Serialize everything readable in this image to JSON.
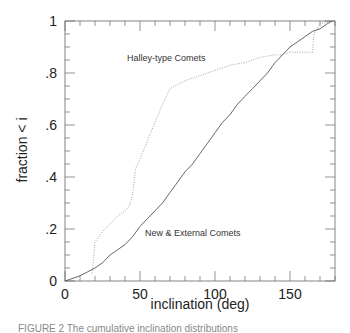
{
  "chart_data": {
    "type": "line",
    "title": "",
    "xlabel": "inclination (deg)",
    "ylabel": "fraction < i",
    "xlim": [
      0,
      180
    ],
    "ylim": [
      0,
      1
    ],
    "x_ticks": [
      0,
      50,
      100,
      150
    ],
    "x_tick_labels": [
      "0",
      "50",
      "100",
      "150"
    ],
    "y_ticks": [
      0,
      0.2,
      0.4,
      0.6,
      0.8,
      1
    ],
    "y_tick_labels": [
      "0",
      ".2",
      ".4",
      ".6",
      ".8",
      "1"
    ],
    "grid": false,
    "legend": "inline annotations",
    "series": [
      {
        "name": "Halley-type Comets",
        "style": "dotted",
        "x": [
          18,
          19,
          20,
          25,
          30,
          35,
          40,
          43,
          45,
          46,
          47,
          50,
          55,
          60,
          65,
          70,
          80,
          90,
          100,
          110,
          120,
          130,
          140,
          145,
          150,
          160,
          165,
          166,
          170,
          180
        ],
        "y": [
          0.03,
          0.08,
          0.15,
          0.19,
          0.22,
          0.25,
          0.27,
          0.29,
          0.33,
          0.38,
          0.43,
          0.47,
          0.54,
          0.61,
          0.68,
          0.74,
          0.77,
          0.79,
          0.81,
          0.83,
          0.84,
          0.86,
          0.87,
          0.87,
          0.88,
          0.88,
          0.88,
          0.95,
          0.99,
          1.0
        ]
      },
      {
        "name": "New & External Comets",
        "style": "solid",
        "x": [
          0,
          10,
          20,
          25,
          30,
          35,
          40,
          45,
          50,
          55,
          60,
          65,
          70,
          75,
          80,
          85,
          90,
          95,
          100,
          105,
          110,
          115,
          120,
          125,
          130,
          135,
          140,
          145,
          150,
          155,
          160,
          165,
          170,
          175,
          178
        ],
        "y": [
          0.0,
          0.02,
          0.05,
          0.07,
          0.1,
          0.12,
          0.14,
          0.17,
          0.21,
          0.24,
          0.27,
          0.3,
          0.34,
          0.38,
          0.42,
          0.45,
          0.49,
          0.53,
          0.57,
          0.61,
          0.64,
          0.68,
          0.71,
          0.74,
          0.77,
          0.8,
          0.84,
          0.87,
          0.9,
          0.92,
          0.94,
          0.96,
          0.97,
          0.99,
          1.0
        ]
      }
    ],
    "annotations": [
      {
        "text": "Halley-type Comets",
        "x": 100,
        "y": 0.84
      },
      {
        "text": "New & External Comets",
        "x": 97,
        "y": 0.19
      }
    ]
  },
  "labels": {
    "xlabel": "inclination (deg)",
    "ylabel": "fraction < i",
    "ann_halley": "Halley-type Comets",
    "ann_new": "New & External Comets",
    "caption": "FIGURE 2   The cumulative inclination distributions"
  }
}
